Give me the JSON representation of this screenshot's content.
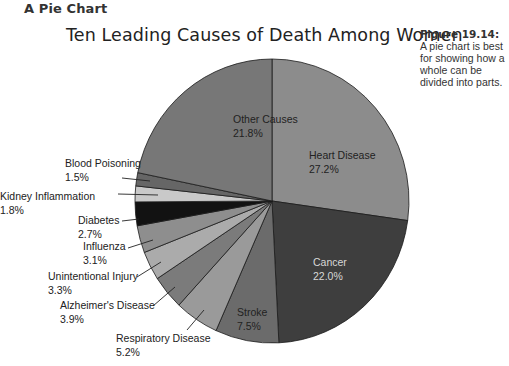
{
  "header": {
    "section_title": "A Pie Chart"
  },
  "caption": {
    "figure_label": "Figure 19.14:",
    "text": "A pie chart is best for showing how a whole can be divided into parts."
  },
  "chart_data": {
    "type": "pie",
    "title": "Ten Leading Causes of Death Among Women",
    "start_angle_deg": 0,
    "direction": "clockwise",
    "unit": "%",
    "slices": [
      {
        "label": "Heart Disease",
        "value": 27.2,
        "value_text": "27.2%",
        "color": "#8c8c8c",
        "label_inside": true,
        "label_pos": [
          309,
          148
        ],
        "text_light": false
      },
      {
        "label": "Cancer",
        "value": 22.0,
        "value_text": "22.0%",
        "color": "#3e3e3e",
        "label_inside": true,
        "label_pos": [
          313,
          255
        ],
        "text_light": true
      },
      {
        "label": "Stroke",
        "value": 7.5,
        "value_text": "7.5%",
        "color": "#6b6b6b",
        "label_inside": true,
        "label_pos": [
          237,
          305
        ],
        "text_light": false
      },
      {
        "label": "Respiratory Disease",
        "value": 5.2,
        "value_text": "5.2%",
        "color": "#9a9a9a",
        "label_inside": false,
        "label_pos": [
          116,
          331
        ],
        "leader": [
          [
            187,
            330
          ],
          [
            204,
            310
          ]
        ]
      },
      {
        "label": "Alzheimer's Disease",
        "value": 3.9,
        "value_text": "3.9%",
        "color": "#7b7b7b",
        "label_inside": false,
        "label_pos": [
          60,
          298
        ],
        "leader": [
          [
            153,
            306
          ],
          [
            175,
            287
          ]
        ]
      },
      {
        "label": "Unintentional Injury",
        "value": 3.3,
        "value_text": "3.3%",
        "color": "#ababab",
        "label_inside": false,
        "label_pos": [
          48,
          269
        ],
        "leader": [
          [
            137,
            277
          ],
          [
            161,
            262
          ]
        ]
      },
      {
        "label": "Influenza",
        "value": 3.1,
        "value_text": "3.1%",
        "color": "#8e8e8e",
        "label_inside": false,
        "label_pos": [
          83,
          239
        ],
        "leader": [
          [
            128,
            248
          ],
          [
            153,
            240
          ]
        ]
      },
      {
        "label": "Diabetes",
        "value": 2.7,
        "value_text": "2.7%",
        "color": "#121212",
        "label_inside": false,
        "label_pos": [
          78,
          213
        ],
        "leader": [
          [
            122,
            221
          ],
          [
            139,
            219
          ]
        ]
      },
      {
        "label": "Kidney Inflammation",
        "value": 1.8,
        "value_text": "1.8%",
        "color": "#c9c9c9",
        "label_inside": false,
        "label_pos": [
          0,
          189
        ],
        "leader": [
          [
            118,
            194
          ],
          [
            158,
            195
          ]
        ]
      },
      {
        "label": "Blood Poisoning",
        "value": 1.5,
        "value_text": "1.5%",
        "color": "#666666",
        "label_inside": false,
        "label_pos": [
          65,
          156
        ],
        "leader": [
          [
            122,
            178
          ],
          [
            150,
            181
          ]
        ]
      },
      {
        "label": "Other Causes",
        "value": 21.8,
        "value_text": "21.8%",
        "color": "#777777",
        "label_inside": true,
        "label_pos": [
          233,
          112
        ],
        "text_light": false
      }
    ],
    "center": [
      272,
      201
    ],
    "radius": [
      137,
      142
    ],
    "legend": "none"
  }
}
